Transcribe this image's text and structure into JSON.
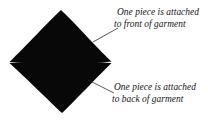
{
  "figure": {
    "background_color": "#ffffff",
    "shape_color": "#080808",
    "leader_line_color": "#2b2b2b"
  },
  "shape": {
    "name": "two-piece-diamond",
    "top_piece_name": "front-piece",
    "bottom_piece_name": "back-piece",
    "apex_top": "61,10",
    "apex_bottom": "62,113",
    "point_left": "9,62",
    "point_right": "112,62"
  },
  "annotations": [
    {
      "id": "front",
      "line1": "One piece is attached",
      "line2": "to front of garment",
      "leader_from": "93,42",
      "leader_to": "118,28"
    },
    {
      "id": "back",
      "line1": "One piece is attached",
      "line2": "to back of garment",
      "leader_from": "88,80",
      "leader_to": "114,93"
    }
  ]
}
